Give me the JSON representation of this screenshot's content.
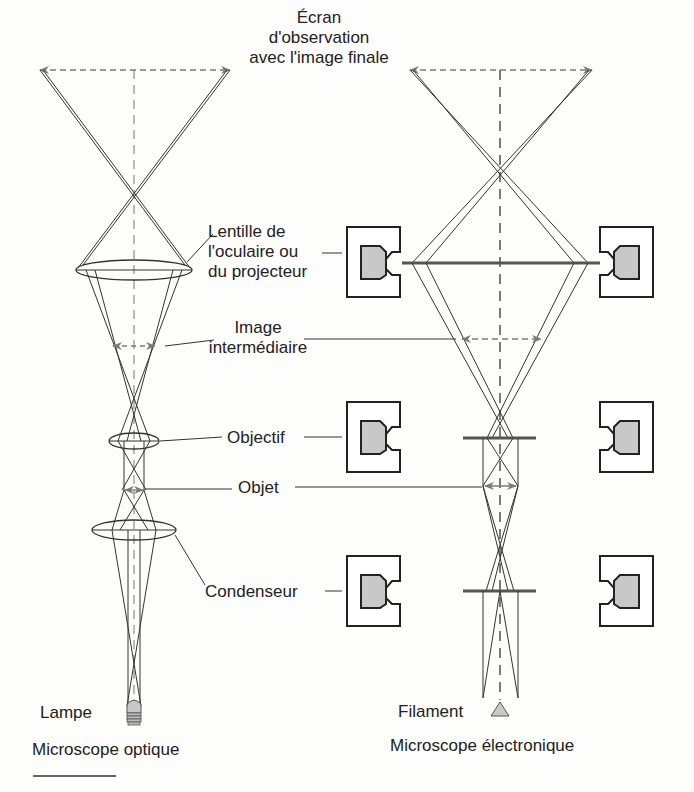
{
  "labels": {
    "screen": [
      "Écran",
      "d'observation",
      "avec l'image finale"
    ],
    "eyepiece_projector": [
      "Lentille de",
      "l'oculaire ou",
      "du projecteur"
    ],
    "intermediate_image": [
      "Image",
      "intermédiaire"
    ],
    "objective": "Objectif",
    "object": "Objet",
    "condenser": "Condenseur",
    "lamp": "Lampe",
    "filament": "Filament"
  },
  "captions": {
    "optical": "Microscope optique",
    "electron": "Microscope électronique"
  },
  "colors": {
    "line": "#333333",
    "arrow": "#7a7a7a",
    "coil_fill": "#c8c8c8",
    "background": "#fdfdfb"
  }
}
